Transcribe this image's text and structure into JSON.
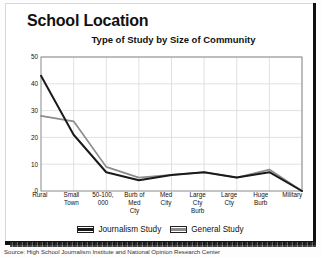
{
  "header": {
    "school_title": "School Location"
  },
  "source": {
    "text": "Source: High School Journalism Institute and National Opinion Research Center"
  },
  "colors": {
    "journalism": "#1a1a1a",
    "general": "#8c8c8c",
    "grid": "#d9d9d9",
    "axis": "#8a8a8a",
    "frame": "#111111"
  },
  "chart_data": {
    "type": "line",
    "title": "Type of Study by Size of Community",
    "xlabel": "",
    "ylabel": "",
    "ylim": [
      0,
      50
    ],
    "yticks": [
      0,
      10,
      20,
      30,
      40,
      50
    ],
    "grid": true,
    "legend_position": "bottom",
    "categories": [
      "Rural",
      "Small\nTown",
      "50-100,\n000",
      "Burb of\nMed\nCty",
      "Med\nCity",
      "Large\nCty\nBurb",
      "Large\nCty",
      "Huge\nBurb",
      "Military"
    ],
    "series": [
      {
        "name": "Journalism Study",
        "color": "#1a1a1a",
        "values": [
          43,
          21,
          7,
          4,
          6,
          7,
          5,
          7,
          0
        ]
      },
      {
        "name": "General Study",
        "color": "#8c8c8c",
        "values": [
          28,
          26,
          9,
          5,
          6,
          7,
          5,
          8,
          0
        ]
      }
    ]
  }
}
